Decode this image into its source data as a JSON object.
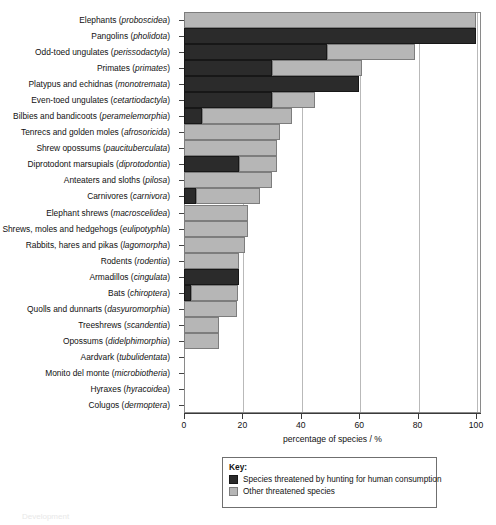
{
  "chart_data": {
    "type": "bar",
    "orientation": "horizontal",
    "stacked": true,
    "title": "",
    "xlabel": "percentage of species / %",
    "ylabel": "",
    "xlim": [
      0,
      100
    ],
    "xticks": [
      0,
      20,
      40,
      60,
      80,
      100
    ],
    "grid": "vertical",
    "legend_position": "below-plot",
    "legend_title": "Key:",
    "series": [
      {
        "name": "Species threatened by hunting for human consumption",
        "color": "#2b2b2b",
        "values": [
          0,
          100,
          49,
          30,
          60,
          30,
          6,
          0,
          0,
          19,
          0,
          4,
          0,
          0,
          0,
          0,
          19,
          2.5,
          0,
          0,
          0,
          0,
          0,
          0,
          0
        ]
      },
      {
        "name": "Other threatened species",
        "color": "#b6b6b6",
        "values": [
          100,
          0,
          30,
          31,
          0,
          15,
          31,
          33,
          32,
          13,
          30,
          22,
          22,
          22,
          21,
          19,
          0,
          16,
          18,
          12,
          12,
          0,
          0,
          0,
          0
        ]
      }
    ],
    "categories": [
      "Elephants (proboscidea)",
      "Pangolins (pholidota)",
      "Odd-toed ungulates (perissodactyla)",
      "Primates (primates)",
      "Platypus and echidnas (monotremata)",
      "Even-toed ungulates (cetartiodactyla)",
      "Bilbies and bandicoots (peramelemorphia)",
      "Tenrecs and golden moles (afrosoricida)",
      "Shrew opossums (paucituberculata)",
      "Diprotodont marsupials (diprotodontia)",
      "Anteaters and sloths (pilosa)",
      "Carnivores (carnivora)",
      "Elephant shrews (macroscelidea)",
      "Shrews, moles and hedgehogs (eulipotyphla)",
      "Rabbits, hares and pikas (lagomorpha)",
      "Rodents (rodentia)",
      "Armadillos (cingulata)",
      "Bats (chiroptera)",
      "Quolls and dunnarts (dasyuromorphia)",
      "Treeshrews (scandentia)",
      "Opossums (didelphimorphia)",
      "Aardvark (tubulidentata)",
      "Monito del monte (microbiotheria)",
      "Hyraxes (hyracoidea)",
      "Colugos (dermoptera)"
    ],
    "category_parts": [
      {
        "common": "Elephants",
        "latin": "proboscidea"
      },
      {
        "common": "Pangolins",
        "latin": "pholidota"
      },
      {
        "common": "Odd-toed ungulates",
        "latin": "perissodactyla"
      },
      {
        "common": "Primates",
        "latin": "primates"
      },
      {
        "common": "Platypus and echidnas",
        "latin": "monotremata"
      },
      {
        "common": "Even-toed ungulates",
        "latin": "cetartiodactyla"
      },
      {
        "common": "Bilbies and bandicoots",
        "latin": "peramelemorphia"
      },
      {
        "common": "Tenrecs and golden moles",
        "latin": "afrosoricida"
      },
      {
        "common": "Shrew opossums",
        "latin": "paucituberculata"
      },
      {
        "common": "Diprotodont marsupials",
        "latin": "diprotodontia"
      },
      {
        "common": "Anteaters and sloths",
        "latin": "pilosa"
      },
      {
        "common": "Carnivores",
        "latin": "carnivora"
      },
      {
        "common": "Elephant shrews",
        "latin": "macroscelidea"
      },
      {
        "common": "Shrews, moles and hedgehogs",
        "latin": "eulipotyphla"
      },
      {
        "common": "Rabbits, hares and pikas",
        "latin": "lagomorpha"
      },
      {
        "common": "Rodents",
        "latin": "rodentia"
      },
      {
        "common": "Armadillos",
        "latin": "cingulata"
      },
      {
        "common": "Bats",
        "latin": "chiroptera"
      },
      {
        "common": "Quolls and dunnarts",
        "latin": "dasyuromorphia"
      },
      {
        "common": "Treeshrews",
        "latin": "scandentia"
      },
      {
        "common": "Opossums",
        "latin": "didelphimorphia"
      },
      {
        "common": "Aardvark",
        "latin": "tubulidentata"
      },
      {
        "common": "Monito del monte",
        "latin": "microbiotheria"
      },
      {
        "common": "Hyraxes",
        "latin": "hyracoidea"
      },
      {
        "common": "Colugos",
        "latin": "dermoptera"
      }
    ]
  },
  "axis": {
    "x_title": "percentage of species / %",
    "x_tick_labels": [
      "0",
      "20",
      "40",
      "60",
      "80",
      "100"
    ]
  },
  "legend": {
    "title": "Key:",
    "entries": [
      {
        "label": "Species threatened by hunting for human consumption",
        "color": "#2b2b2b"
      },
      {
        "label": "Other threatened species",
        "color": "#b6b6b6"
      }
    ]
  },
  "footer": {
    "note": "Development"
  },
  "colors": {
    "dark_series": "#2b2b2b",
    "light_series": "#b6b6b6",
    "grid": "#b9b9b9",
    "axis": "#3a3a3a",
    "frame": "#8a8a8a"
  }
}
